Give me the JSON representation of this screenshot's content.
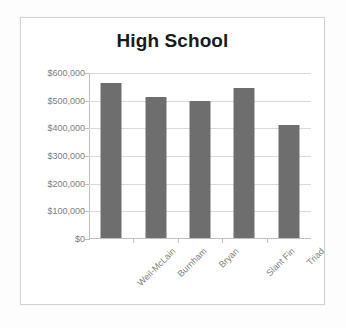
{
  "chart_data": {
    "type": "bar",
    "title": "High School",
    "xlabel": "",
    "ylabel": "",
    "categories": [
      "Weil-McLain",
      "Burnham",
      "Bryan",
      "Slant Fin",
      "Triad"
    ],
    "values": [
      565000,
      513000,
      500000,
      545000,
      412000
    ],
    "ylim": [
      0,
      600000
    ],
    "y_ticks": [
      0,
      100000,
      200000,
      300000,
      400000,
      500000,
      600000
    ],
    "y_tick_labels": [
      "$0",
      "$100,000",
      "$200,000",
      "$300,000",
      "$400,000",
      "$500,000",
      "$600,000"
    ],
    "grid": true,
    "legend": "none",
    "bar_color": "#6e6e6e",
    "gridline_color": "#d9d9d9",
    "axis_color": "#bfbfbf",
    "tick_label_color": "#7d7d7d",
    "title_color": "#1a1a1a",
    "plot_background": "#ffffff",
    "x_label_rotation": -45
  }
}
